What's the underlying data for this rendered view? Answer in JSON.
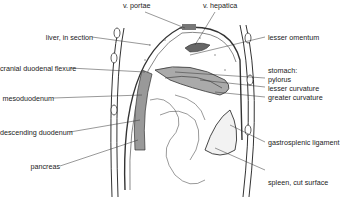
{
  "diagram": {
    "type": "anatomical-illustration",
    "labels_left": [
      {
        "id": "liver",
        "text": "liver, in section",
        "x": 115,
        "y": 37
      },
      {
        "id": "cranial-duodenal-flexure",
        "text": "cranial duodenal flexure",
        "x": 92,
        "y": 68
      },
      {
        "id": "mesoduodenum",
        "text": "mesoduodenum",
        "x": 85,
        "y": 98
      },
      {
        "id": "descending-duodenum",
        "text": "descending duodenum",
        "x": 88,
        "y": 132
      },
      {
        "id": "pancreas",
        "text": "pancreas",
        "x": 86,
        "y": 166
      }
    ],
    "labels_top": [
      {
        "id": "v-portae",
        "text": "v. portae",
        "x": 128,
        "y": 3
      },
      {
        "id": "v-hepatica",
        "text": "v. hepatica",
        "x": 203,
        "y": 3
      }
    ],
    "labels_right": [
      {
        "id": "lesser-omentum",
        "text": "lesser omentum",
        "x": 268,
        "y": 33
      },
      {
        "id": "stomach",
        "text": "stomach:",
        "x": 268,
        "y": 66
      },
      {
        "id": "pylorus",
        "text": "pylorus",
        "x": 268,
        "y": 75
      },
      {
        "id": "lesser-curvature",
        "text": "lesser curvature",
        "x": 268,
        "y": 84
      },
      {
        "id": "greater-curvature",
        "text": "greater curvature",
        "x": 268,
        "y": 94
      },
      {
        "id": "gastrosplenic-ligament",
        "text": "gastrosplenic ligament",
        "x": 268,
        "y": 139
      },
      {
        "id": "spleen",
        "text": "spleen, cut surface",
        "x": 268,
        "y": 179
      }
    ]
  }
}
